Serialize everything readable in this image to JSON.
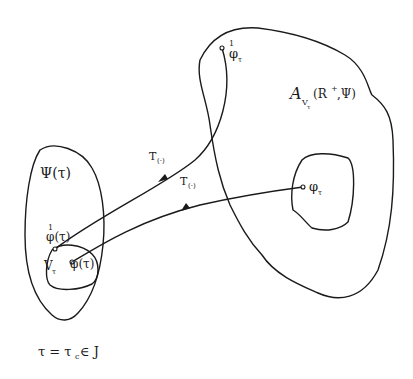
{
  "diagram": {
    "colors": {
      "ink": "#1a1a1a",
      "background": "#ffffff"
    },
    "left_region": {
      "label": "Ψ(τ)",
      "inner_region_label": "V",
      "inner_region_subscript": "τ"
    },
    "points": {
      "phi_dot_tau": {
        "accent": "1",
        "base": "φ(τ)"
      },
      "phi_tau": {
        "label": "φ(τ)"
      },
      "phi_dot_target": {
        "accent": "1",
        "base": "φ",
        "subscript": "τ"
      },
      "phi_target": {
        "base": "φ",
        "subscript": "τ"
      }
    },
    "right_region": {
      "symbol": "A",
      "subscript": "V",
      "subsubscript": "τ",
      "args": "(R",
      "sup": "+",
      "args_end": ",Ψ)"
    },
    "arrows": {
      "upper": {
        "label": "T",
        "sub": "(·)"
      },
      "lower": {
        "label": "T",
        "sub": "(·)"
      }
    },
    "caption": {
      "lhs": "τ = τ",
      "sub": "c",
      "rhs": " ∈ J"
    }
  }
}
